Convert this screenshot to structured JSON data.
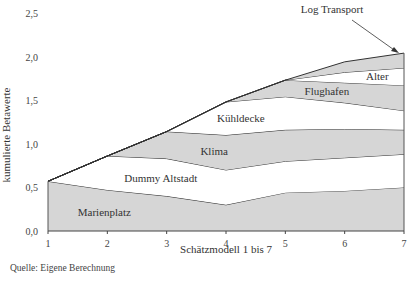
{
  "chart_data": {
    "type": "area",
    "stacked": true,
    "title": "",
    "xlabel": "Schätzmodell 1 bis 7",
    "ylabel": "kumulierte Betawerte",
    "x": [
      1,
      2,
      3,
      4,
      5,
      6,
      7
    ],
    "x_ticks": [
      "1",
      "2",
      "3",
      "4",
      "5",
      "6",
      "7"
    ],
    "y_ticks": [
      "0,0",
      "0,5",
      "1,0",
      "1,5",
      "2,0",
      "2,5"
    ],
    "y_tick_values": [
      0,
      0.5,
      1.0,
      1.5,
      2.0,
      2.5
    ],
    "ylim": [
      0,
      2.5
    ],
    "xlim": [
      1,
      7
    ],
    "grid": false,
    "legend": "inline labels",
    "series": [
      {
        "name": "Marienplatz",
        "fill": "#d6d6d6",
        "cumulative": [
          0.57,
          0.47,
          0.4,
          0.3,
          0.44,
          0.46,
          0.5
        ],
        "label_pos": [
          1.95,
          0.22
        ]
      },
      {
        "name": "Dummy Altstadt",
        "fill": "#ffffff",
        "cumulative": [
          0.57,
          0.86,
          0.83,
          0.7,
          0.8,
          0.84,
          0.88
        ],
        "label_pos": [
          2.9,
          0.61
        ]
      },
      {
        "name": "Klima",
        "fill": "#d6d6d6",
        "cumulative": [
          0.57,
          0.86,
          1.14,
          1.1,
          1.16,
          1.17,
          1.16
        ],
        "label_pos": [
          3.8,
          0.92
        ]
      },
      {
        "name": "Kühldecke",
        "fill": "#ffffff",
        "cumulative": [
          0.57,
          0.86,
          1.14,
          1.48,
          1.54,
          1.47,
          1.38
        ],
        "label_pos": [
          4.25,
          1.3
        ]
      },
      {
        "name": "Flughafen",
        "fill": "#d6d6d6",
        "cumulative": [
          0.57,
          0.86,
          1.14,
          1.48,
          1.73,
          1.7,
          1.67
        ],
        "label_pos": [
          5.7,
          1.6
        ]
      },
      {
        "name": "Alter",
        "fill": "#ffffff",
        "cumulative": [
          0.57,
          0.86,
          1.14,
          1.48,
          1.73,
          1.82,
          1.87
        ],
        "label_pos": [
          6.55,
          1.78
        ]
      },
      {
        "name": "Log Transport",
        "fill": "#d6d6d6",
        "cumulative": [
          0.57,
          0.86,
          1.14,
          1.48,
          1.73,
          1.94,
          2.04
        ],
        "label_pos": [
          5.45,
          2.3
        ]
      }
    ],
    "annotations": [
      {
        "text": "Log Transport",
        "arrow_from": [
          6.0,
          2.2
        ],
        "arrow_to": [
          6.85,
          2.02
        ]
      }
    ]
  },
  "source_note": "Quelle: Eigene Berechnung"
}
